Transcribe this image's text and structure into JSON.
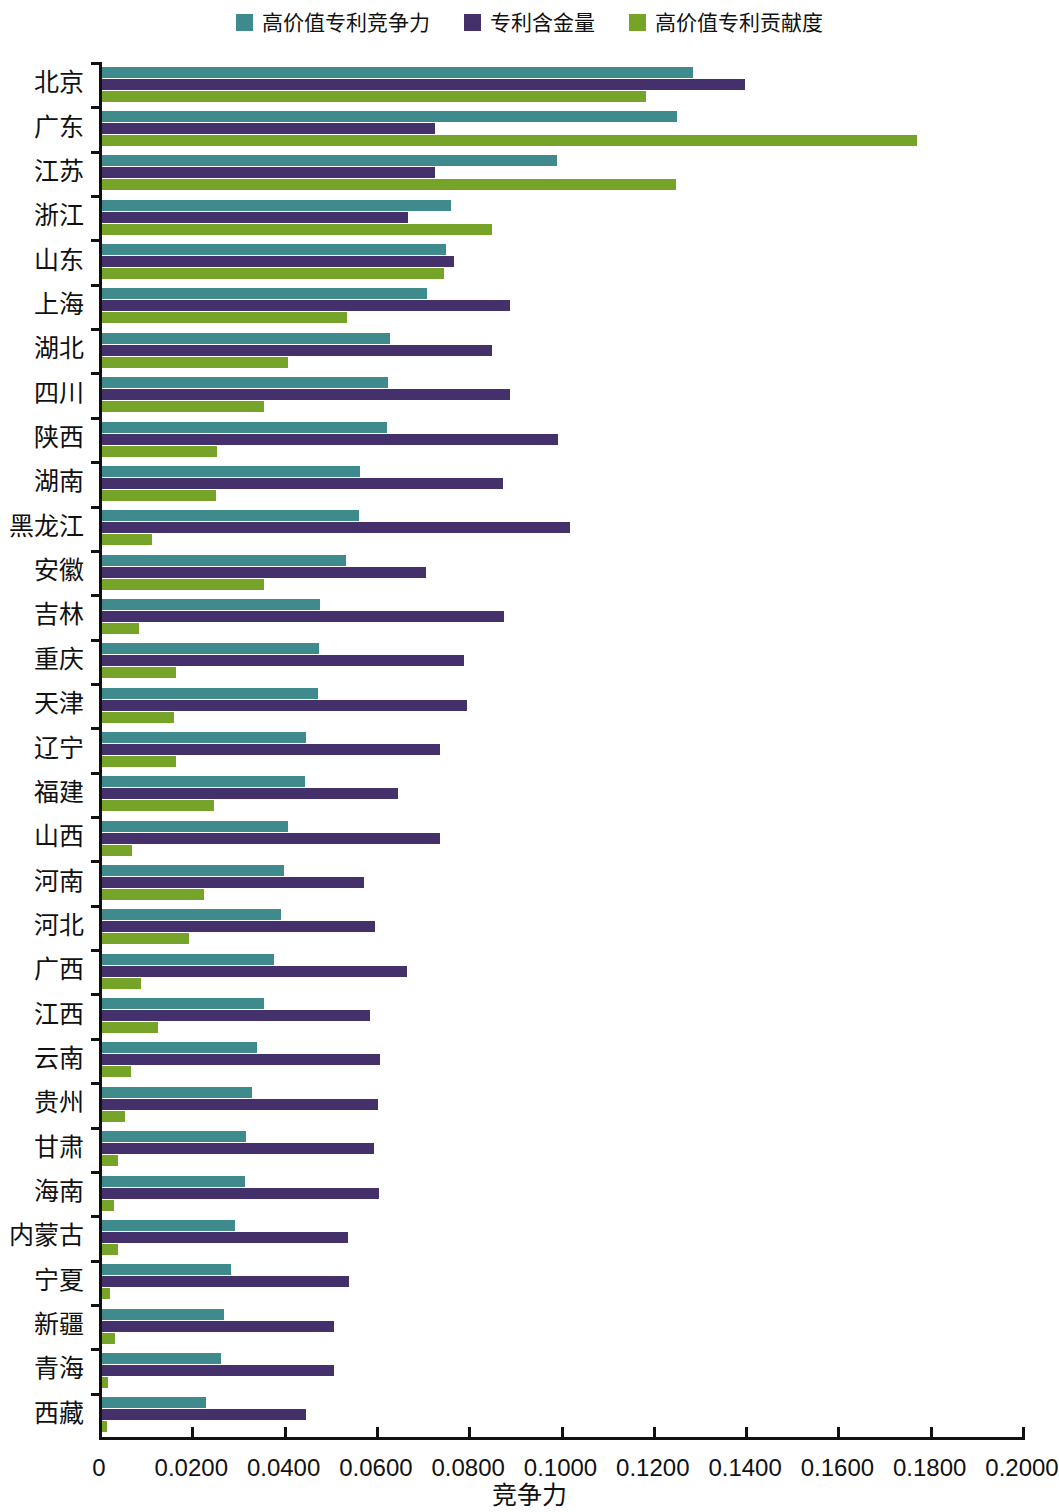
{
  "legend": {
    "position": "top-center",
    "entries": [
      {
        "label": "高价值专利竞争力",
        "color": "#3E8A8C"
      },
      {
        "label": "专利含金量",
        "color": "#44306B"
      },
      {
        "label": "高价值专利贡献度",
        "color": "#76A428"
      }
    ]
  },
  "axis": {
    "x_title": "竞争力",
    "x_ticklabels": [
      "0",
      "0.0200",
      "0.0400",
      "0.0600",
      "0.0800",
      "0.1000",
      "0.1200",
      "0.1400",
      "0.1600",
      "0.1800",
      "0.2000"
    ],
    "y_title": ""
  },
  "chart_data": {
    "type": "bar",
    "orientation": "horizontal",
    "title": "",
    "subtitle": "",
    "xlabel": "竞争力",
    "ylabel": "",
    "xlim": [
      0,
      0.2
    ],
    "xticks": [
      0,
      0.02,
      0.04,
      0.06,
      0.08,
      0.1,
      0.12,
      0.14,
      0.16,
      0.18,
      0.2
    ],
    "grid": false,
    "legend_position": "top-center",
    "categories": [
      "北京",
      "广东",
      "江苏",
      "浙江",
      "山东",
      "上海",
      "湖北",
      "四川",
      "陕西",
      "湖南",
      "黑龙江",
      "安徽",
      "吉林",
      "重庆",
      "天津",
      "辽宁",
      "福建",
      "山西",
      "河南",
      "河北",
      "广西",
      "江西",
      "云南",
      "贵州",
      "甘肃",
      "海南",
      "内蒙古",
      "宁夏",
      "新疆",
      "青海",
      "西藏"
    ],
    "series": [
      {
        "name": "高价值专利竞争力",
        "color": "#3E8A8C",
        "values": [
          0.128,
          0.1245,
          0.0985,
          0.0757,
          0.0745,
          0.0705,
          0.0625,
          0.062,
          0.0618,
          0.0558,
          0.0557,
          0.0528,
          0.0472,
          0.047,
          0.0468,
          0.0443,
          0.044,
          0.0402,
          0.0395,
          0.0388,
          0.0372,
          0.0352,
          0.0335,
          0.0325,
          0.0312,
          0.031,
          0.0288,
          0.028,
          0.0265,
          0.0258,
          0.0225
        ]
      },
      {
        "name": "专利含金量",
        "color": "#44306B",
        "values": [
          0.1393,
          0.0722,
          0.0722,
          0.0663,
          0.0762,
          0.0885,
          0.0845,
          0.0885,
          0.0988,
          0.0868,
          0.1015,
          0.0703,
          0.0872,
          0.0785,
          0.079,
          0.0733,
          0.0642,
          0.0733,
          0.0567,
          0.0592,
          0.066,
          0.058,
          0.0603,
          0.0597,
          0.059,
          0.06,
          0.0533,
          0.0535,
          0.0502,
          0.0503,
          0.0442
        ]
      },
      {
        "name": "高价值专利贡献度",
        "color": "#76A428",
        "values": [
          0.1178,
          0.1765,
          0.1243,
          0.0845,
          0.0742,
          0.053,
          0.0403,
          0.0352,
          0.025,
          0.0247,
          0.0108,
          0.035,
          0.008,
          0.016,
          0.0155,
          0.016,
          0.0243,
          0.0065,
          0.022,
          0.0188,
          0.0085,
          0.0122,
          0.0063,
          0.005,
          0.0035,
          0.0025,
          0.0035,
          0.0018,
          0.0028,
          0.0012,
          0.001
        ]
      }
    ]
  }
}
